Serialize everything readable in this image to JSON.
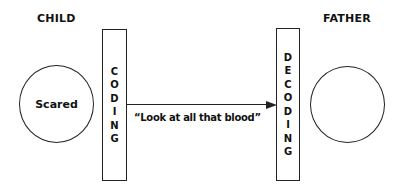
{
  "diagram": {
    "sender": {
      "label": "CHILD",
      "state": "Scared"
    },
    "receiver": {
      "label": "FATHER",
      "state": ""
    },
    "encoding": {
      "label": "CODING"
    },
    "decoding": {
      "label": "DECODING"
    },
    "message": {
      "text": "“Look at all that blood”"
    }
  }
}
